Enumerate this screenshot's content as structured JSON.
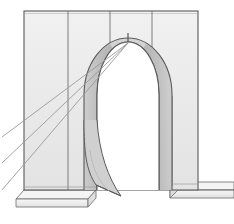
{
  "document": {
    "title": "Arch Construction Perspective Sketch",
    "subject": "masonry-arch-with-piers",
    "medium": "line-drawing",
    "background_color": "#ffffff"
  },
  "canvas": {
    "width": 234,
    "height": 224
  },
  "palette": {
    "paper": "#ffffff",
    "wall_fill": "#e9e9e9",
    "wall_fill_light": "#efefef",
    "panel_fill": "#ebebeb",
    "arch_band_fill": "#bdbdbd",
    "arch_band_fill_light": "#d2d2d2",
    "arch_band_fill_dark": "#a8a8a8",
    "opening_fill": "#ffffff",
    "plinth_fill": "#f2f2f2",
    "plinth_shadow": "#dcdcdc",
    "outline": "#555555",
    "outline_soft": "#888888",
    "ray_line": "#9a9a9a",
    "panel_divider": "#6f6f6f"
  },
  "geometry": {
    "wall": {
      "left": 24,
      "right": 198,
      "top": 11,
      "bottom": 190,
      "note": "flat front face of the masonry wall"
    },
    "panel_dividers_x": [
      68,
      110,
      152
    ],
    "arch": {
      "crown_x": 128,
      "crown_y": 42,
      "outer_left_x": 84,
      "outer_right_x": 172,
      "inner_left_x": 97,
      "inner_right_x": 159,
      "springing_y": 95,
      "band_thickness": 13,
      "keystone_mark_y_top": 33,
      "keystone_mark_y_bottom": 46
    },
    "plinth": {
      "left_top_y": 190,
      "left_bottom_y": 205,
      "left_x_start": 20,
      "left_x_end": 96,
      "right_top_y": 182,
      "right_bottom_y": 196,
      "right_x_start": 170,
      "right_x_end": 234
    },
    "rays": {
      "count": 3,
      "converge_x": 128,
      "converge_y": 43,
      "exit_edge": "left",
      "exit_y": [
        137,
        163,
        190
      ]
    },
    "peeling_band": {
      "description": "left arch band splays outward and ends as a loose strip near the base",
      "tip_x": 121,
      "tip_y": 196
    }
  },
  "labels": {
    "figure_caption": "",
    "annotations": []
  }
}
